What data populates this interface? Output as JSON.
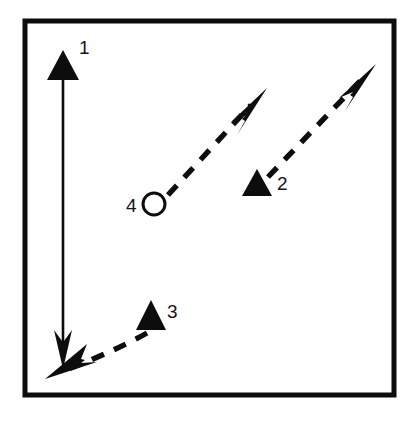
{
  "figure": {
    "background_color": "#ffffff",
    "ink_color": "#0d0d0d",
    "frame": {
      "name": "outer-border-rectangle",
      "x": 25,
      "y": 21,
      "width": 369,
      "height": 374,
      "stroke_width": 5
    },
    "labels": [
      {
        "id": "1",
        "text": "1",
        "x": 79,
        "y": 54
      },
      {
        "id": "2",
        "text": "2",
        "x": 277,
        "y": 190
      },
      {
        "id": "3",
        "text": "3",
        "x": 167,
        "y": 318
      },
      {
        "id": "4",
        "text": "4",
        "x": 126,
        "y": 212
      }
    ],
    "marker": {
      "name": "open-circle-marker",
      "label": "4",
      "cx": 154,
      "cy": 204,
      "r": 11,
      "stroke_width": 3,
      "fill": "none"
    },
    "vectors": [
      {
        "id": "1",
        "name": "vector-1-vertical-double-arrow",
        "style": "solid",
        "description": "solid vertical line with a large filled triangle head pointing up at the top and a thin barbed arrowhead pointing down at the bottom",
        "x1": 63,
        "y1": 78,
        "x2": 63,
        "y2": 352,
        "head_top": {
          "type": "filled-triangle",
          "tip_x": 63,
          "tip_y": 50,
          "width": 30,
          "height": 30
        },
        "head_bottom": {
          "type": "barbed-arrow",
          "tip_x": 63,
          "tip_y": 367
        }
      },
      {
        "id": "2",
        "name": "vector-2-dashed-up-right",
        "style": "dashed",
        "description": "dashed line running up-right from a filled triangle marker to a thin barbed arrowhead near the top-right",
        "x1": 270,
        "y1": 176,
        "x2": 360,
        "y2": 81,
        "head": {
          "type": "barbed-arrow",
          "tip_x": 375,
          "tip_y": 65
        },
        "origin_marker": {
          "type": "filled-triangle",
          "tip_x": 257,
          "tip_y": 169,
          "width": 32,
          "height": 27
        }
      },
      {
        "id": "3",
        "name": "vector-3-dashed-curve-down-left",
        "style": "dashed",
        "description": "dashed curved line running from a filled triangle marker down-left to a thin barbed arrowhead at the lower-left corner",
        "path": "M 146,333 C 120,347 90,360 66,369",
        "head": {
          "type": "barbed-arrow",
          "tip_x": 46,
          "tip_y": 378
        },
        "origin_marker": {
          "type": "filled-triangle",
          "tip_x": 151,
          "tip_y": 300,
          "width": 30,
          "height": 30
        }
      },
      {
        "id": "4",
        "name": "vector-4-dashed-up-right-from-circle",
        "style": "dashed",
        "description": "dashed line running up-right from the open circle marker to a thin barbed arrowhead",
        "x1": 169,
        "y1": 194,
        "x2": 250,
        "y2": 106,
        "head": {
          "type": "barbed-arrow",
          "tip_x": 266,
          "tip_y": 89
        }
      }
    ]
  }
}
